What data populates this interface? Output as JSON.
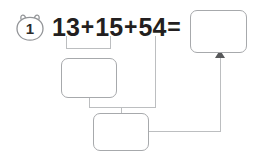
{
  "problem": {
    "number": "1",
    "badge_icon": "rounded-bear-head-badge"
  },
  "equation": {
    "term1": "13",
    "operator1": "+",
    "term2": "15",
    "operator2": "+",
    "term3": "54",
    "equals": "="
  },
  "boxes": {
    "total": {
      "label": "",
      "placeholder": ""
    },
    "part1": {
      "label": "",
      "placeholder": ""
    },
    "part2": {
      "label": "",
      "placeholder": ""
    }
  },
  "colors": {
    "text": "#231f20",
    "box_border": "#a7a9ac",
    "connector": "#bcbec0",
    "arrowhead": "#58595b",
    "background": "#ffffff"
  }
}
